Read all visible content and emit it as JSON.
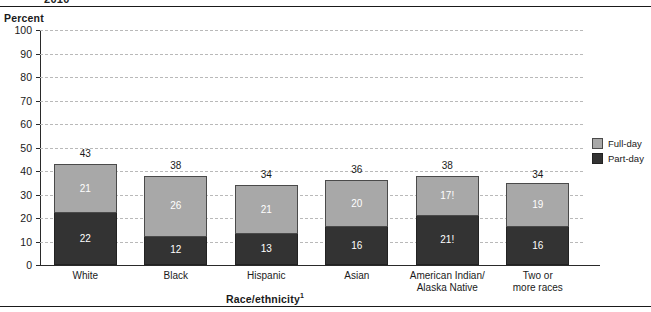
{
  "header": {
    "cropped_title": "2010",
    "percent_axis_label": "Percent"
  },
  "legend": {
    "items": [
      {
        "label": "Full-day",
        "color": "#a8a8a8",
        "key": "full"
      },
      {
        "label": "Part-day",
        "color": "#333333",
        "key": "part"
      }
    ]
  },
  "axis": {
    "x_title": "Race/ethnicity",
    "x_title_footnote": "1",
    "y_ticks": [
      "0",
      "10",
      "20",
      "30",
      "40",
      "50",
      "60",
      "70",
      "80",
      "90",
      "100"
    ]
  },
  "chart_data": {
    "type": "bar",
    "stacked": true,
    "title": "",
    "xlabel": "Race/ethnicity",
    "ylabel": "Percent",
    "ylim": [
      0,
      100
    ],
    "ytick_step": 10,
    "grid": true,
    "legend_position": "right",
    "categories": [
      "White",
      "Black",
      "Hispanic",
      "Asian",
      "American Indian/ Alaska Native",
      "Two or more races"
    ],
    "category_lines": [
      [
        "White"
      ],
      [
        "Black"
      ],
      [
        "Hispanic"
      ],
      [
        "Asian"
      ],
      [
        "American Indian/",
        "Alaska Native"
      ],
      [
        "Two or",
        "more races"
      ]
    ],
    "series": [
      {
        "name": "Part-day",
        "color": "#333333",
        "values": [
          22,
          12,
          13,
          16,
          21,
          16
        ],
        "labels": [
          "22",
          "12",
          "13",
          "16",
          "21!",
          "16"
        ]
      },
      {
        "name": "Full-day",
        "color": "#a8a8a8",
        "values": [
          21,
          26,
          21,
          20,
          17,
          19
        ],
        "labels": [
          "21",
          "26",
          "21",
          "20",
          "17!",
          "19"
        ]
      }
    ],
    "totals": [
      43,
      38,
      34,
      36,
      38,
      34
    ],
    "total_labels": [
      "43",
      "38",
      "34",
      "36",
      "38",
      "34"
    ]
  }
}
